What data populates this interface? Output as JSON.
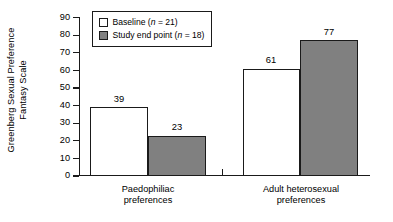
{
  "chart_data": {
    "type": "bar",
    "title": "",
    "xlabel": "",
    "ylabel": "Greenberg Sexual Preference Fantasy Scale",
    "ylabel_line1": "Greenberg Sexual Preference",
    "ylabel_line2": "Fantasy Scale",
    "ylim": [
      0,
      90
    ],
    "ytick_values": [
      0,
      10,
      20,
      30,
      40,
      50,
      60,
      70,
      80,
      90
    ],
    "ytick_labels": [
      "0",
      "10",
      "20",
      "30",
      "40",
      "50",
      "60",
      "70",
      "80",
      "90"
    ],
    "grid": false,
    "legend_position": "top-left",
    "categories": [
      "Paedophiliac preferences",
      "Adult heterosexual preferences"
    ],
    "category_lines": [
      [
        "Paedophiliac",
        "preferences"
      ],
      [
        "Adult heterosexual",
        "preferences"
      ]
    ],
    "series": [
      {
        "name": "Baseline (n = 21)",
        "label_text": "Baseline (",
        "label_italic": "n",
        "label_tail": " = 21)",
        "n": 21,
        "color": "#ffffff",
        "edge_color": "#1a1a1a",
        "values": [
          39,
          61
        ],
        "value_labels": [
          "39",
          "61"
        ]
      },
      {
        "name": "Study end point (n = 18)",
        "label_text": "Study end point (",
        "label_italic": "n",
        "label_tail": " = 18)",
        "n": 18,
        "color": "#808080",
        "edge_color": "#1a1a1a",
        "values": [
          23,
          77
        ],
        "value_labels": [
          "23",
          "77"
        ]
      }
    ]
  },
  "colors": {
    "baseline_fill": "#ffffff",
    "endpoint_fill": "#808080",
    "axis": "#1a1a1a",
    "background": "#ffffff"
  }
}
